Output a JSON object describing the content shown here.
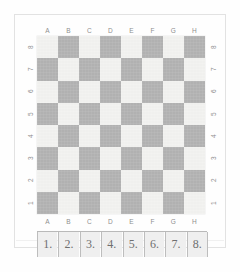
{
  "page": {
    "background_color": "#fefefe",
    "border_color": "#e2e2e2"
  },
  "board": {
    "files": [
      "A",
      "B",
      "C",
      "D",
      "E",
      "F",
      "G",
      "H"
    ],
    "ranks": [
      "8",
      "7",
      "6",
      "5",
      "4",
      "3",
      "2",
      "1"
    ],
    "light_color": "#f2f2f0",
    "dark_color": "#b3b3b3",
    "rows": 8,
    "columns": 8,
    "top_left_square_color": "light",
    "squares": [
      [
        "light",
        "dark",
        "light",
        "dark",
        "light",
        "dark",
        "light",
        "dark"
      ],
      [
        "dark",
        "light",
        "dark",
        "light",
        "dark",
        "light",
        "dark",
        "light"
      ],
      [
        "light",
        "dark",
        "light",
        "dark",
        "light",
        "dark",
        "light",
        "dark"
      ],
      [
        "dark",
        "light",
        "dark",
        "light",
        "dark",
        "light",
        "dark",
        "light"
      ],
      [
        "light",
        "dark",
        "light",
        "dark",
        "light",
        "dark",
        "light",
        "dark"
      ],
      [
        "dark",
        "light",
        "dark",
        "light",
        "dark",
        "light",
        "dark",
        "light"
      ],
      [
        "light",
        "dark",
        "light",
        "dark",
        "light",
        "dark",
        "light",
        "dark"
      ],
      [
        "dark",
        "light",
        "dark",
        "light",
        "dark",
        "light",
        "dark",
        "light"
      ]
    ]
  },
  "answer_strip": {
    "cells": [
      "1.",
      "2.",
      "3.",
      "4.",
      "5.",
      "6.",
      "7.",
      "8."
    ],
    "cell_background": "#efefef",
    "cell_border": "#bdbdbd"
  }
}
